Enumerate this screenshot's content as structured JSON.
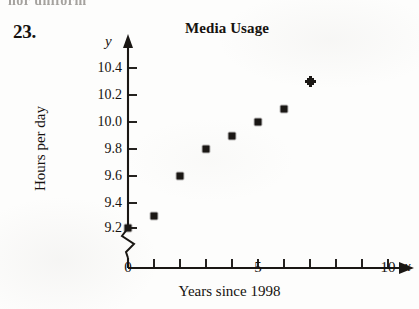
{
  "page": {
    "problem_number": "23.",
    "top_cropped_text": "nor uniform"
  },
  "chart_data": {
    "type": "scatter",
    "title": "Media Usage",
    "xlabel": "Years since 1998",
    "ylabel": "Hours per day",
    "x_axis_letter": "x",
    "y_axis_letter": "y",
    "x": [
      0,
      1,
      2,
      3,
      4,
      5,
      6,
      7
    ],
    "values": [
      9.2,
      9.3,
      9.6,
      9.8,
      9.9,
      10.0,
      10.1,
      10.3
    ],
    "points": [
      {
        "x": 0,
        "y": 9.2
      },
      {
        "x": 1,
        "y": 9.3
      },
      {
        "x": 2,
        "y": 9.6
      },
      {
        "x": 3,
        "y": 9.8
      },
      {
        "x": 4,
        "y": 9.9
      },
      {
        "x": 5,
        "y": 10.0
      },
      {
        "x": 6,
        "y": 10.1
      },
      {
        "x": 7,
        "y": 10.3
      }
    ],
    "xlim": [
      0,
      10
    ],
    "ylim": [
      9.2,
      10.4
    ],
    "x_ticks": [
      0,
      1,
      2,
      3,
      4,
      5,
      6,
      7,
      8,
      9,
      10
    ],
    "x_tick_labels": [
      {
        "value": 0,
        "label": "0"
      },
      {
        "value": 5,
        "label": "5"
      },
      {
        "value": 10,
        "label": "10"
      }
    ],
    "y_ticks": [
      9.2,
      9.4,
      9.6,
      9.8,
      10.0,
      10.2,
      10.4
    ],
    "y_tick_labels": [
      "9.2",
      "9.4",
      "9.6",
      "9.8",
      "10.0",
      "10.2",
      "10.4"
    ],
    "y_axis_break": true,
    "x_axis_break": true,
    "grid": false,
    "legend": false,
    "marker": "square",
    "colors": {
      "ink": "#1a1714",
      "background": "#fdfdfc"
    }
  }
}
